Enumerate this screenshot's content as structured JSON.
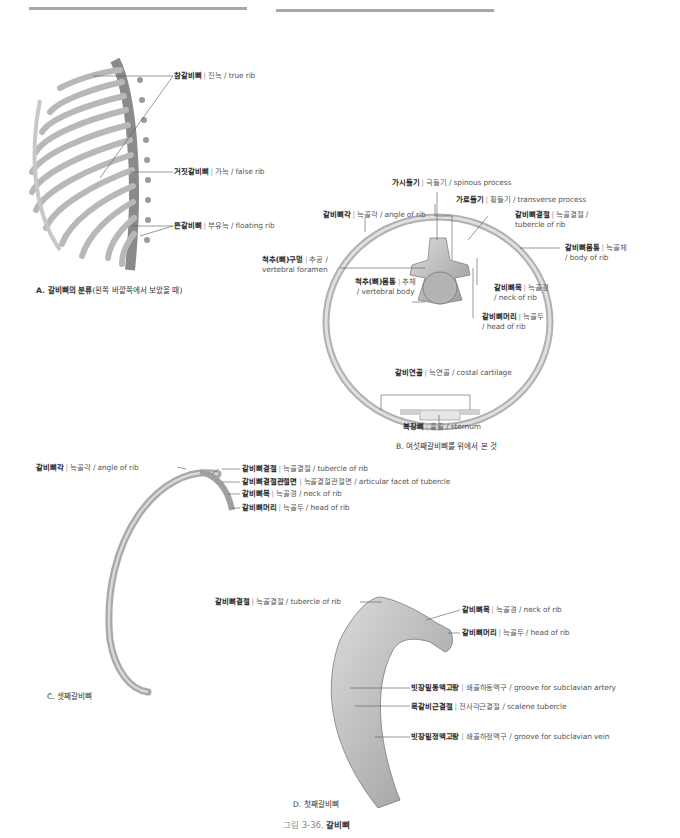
{
  "page": {
    "figure_caption": {
      "prefix": "그림 3-36.",
      "title": "갈비뼈"
    }
  },
  "panel_a": {
    "caption_bold": "A. 갈비뼈의 분류",
    "caption_rest": "(왼쪽 바깥쪽에서 보았을 때)",
    "labels": [
      {
        "ko": "참갈비뼈",
        "alt": "진늑",
        "en": "true rib"
      },
      {
        "ko": "거짓갈비뼈",
        "alt": "가늑",
        "en": "false rib"
      },
      {
        "ko": "뜬갈비뼈",
        "alt": "부유늑",
        "en": "floating rib"
      }
    ]
  },
  "panel_b": {
    "caption": "B. 여섯째갈비뼈를 위에서 본 것",
    "labels": [
      {
        "ko": "가시돌기",
        "alt": "극돌기",
        "en": "spinous process"
      },
      {
        "ko": "가로돌기",
        "alt": "횡돌기",
        "en": "transverse process"
      },
      {
        "ko": "갈비뼈각",
        "alt": "늑골각",
        "en": "angle of rib"
      },
      {
        "ko": "갈비뼈결절",
        "alt": "늑골결절 /",
        "en": "tubercle of rib"
      },
      {
        "ko": "갈비뼈몸통",
        "alt": "늑골체",
        "en": "/ body of rib"
      },
      {
        "ko": "척추(뼈)구멍",
        "alt": "추공 /",
        "en": "vertebral foramen"
      },
      {
        "ko": "척추(뼈)몸통",
        "alt": "추체",
        "en": "/ vertebral body"
      },
      {
        "ko": "갈비뼈목",
        "alt": "늑골경",
        "en": "/ neck of rib"
      },
      {
        "ko": "갈비뼈머리",
        "alt": "늑골두",
        "en": "/ head of rib"
      },
      {
        "ko": "갈비연골",
        "alt": "늑연골",
        "en": "costal cartilage"
      },
      {
        "ko": "복장뼈",
        "alt": "흉골",
        "en": "sternum"
      }
    ]
  },
  "panel_c": {
    "caption": "C. 셋째갈비뼈",
    "labels": [
      {
        "ko": "갈비뼈각",
        "alt": "늑골각",
        "en": "angle of rib"
      },
      {
        "ko": "갈비뼈결절",
        "alt": "늑골결절",
        "en": "tubercle of rib"
      },
      {
        "ko": "갈비뼈결절관절면",
        "alt": "늑골결절관절면",
        "en": "articular facet of tubercle"
      },
      {
        "ko": "갈비뼈목",
        "alt": "늑골경",
        "en": "neck of rib"
      },
      {
        "ko": "갈비뼈머리",
        "alt": "늑골두",
        "en": "head of rib"
      }
    ]
  },
  "panel_d": {
    "caption": "D. 첫째갈비뼈",
    "labels": [
      {
        "ko": "갈비뼈결절",
        "alt": "늑골결절",
        "en": "tubercle of rib"
      },
      {
        "ko": "갈비뼈목",
        "alt": "늑골경",
        "en": "neck of rib"
      },
      {
        "ko": "갈비뼈머리",
        "alt": "늑골두",
        "en": "head of rib"
      },
      {
        "ko": "빗장밑동맥고랑",
        "alt": "쇄골하동맥구",
        "en": "groove for subclavian artery"
      },
      {
        "ko": "목갈비근결절",
        "alt": "전사각근결절",
        "en": "scalene tubercle"
      },
      {
        "ko": "빗장밑정맥고랑",
        "alt": "쇄골하정맥구",
        "en": "groove for subclavian vein"
      }
    ]
  },
  "colors": {
    "rule": "#a8a8a8",
    "bone": "#c9c9c9",
    "bone_dark": "#8e8e8e",
    "text": "#3a3a3a"
  }
}
